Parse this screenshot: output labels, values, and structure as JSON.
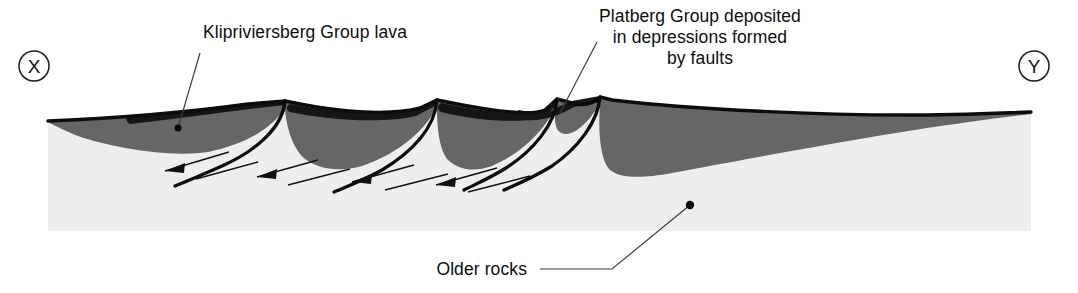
{
  "figure": {
    "kind": "geological-cross-section",
    "title_visible": false,
    "endpoints": {
      "left_label": "X",
      "right_label": "Y"
    },
    "annotations": [
      {
        "id": "klipriviersberg",
        "lines": [
          "Klipriviersberg Group lava"
        ],
        "align": "middle",
        "text_x": 305,
        "text_y": 38,
        "line_height": 21,
        "leader_points": "200,53 178,128",
        "dot_x": 178,
        "dot_y": 128,
        "dot_r": 3.6
      },
      {
        "id": "platberg",
        "lines": [
          "Platberg Group deposited",
          "in depressions formed",
          "by faults"
        ],
        "align": "middle",
        "text_x": 700,
        "text_y": 22,
        "line_height": 21,
        "leader_points": "597,42 560,113",
        "dot_x": null,
        "dot_y": null,
        "dot_r": 0
      },
      {
        "id": "older-rocks",
        "lines": [
          "Older rocks"
        ],
        "align": "end",
        "text_x": 527,
        "text_y": 275,
        "line_height": 21,
        "leader_points": "540,269 612,269 690,205",
        "dot_x": 690,
        "dot_y": 205,
        "dot_r": 4.2
      }
    ],
    "units": [
      {
        "id": "older-rocks-basement",
        "name": "Older rocks",
        "color": "#eeeeee"
      },
      {
        "id": "klipriviersberg-lava",
        "name": "Klipriviersberg Group lava",
        "color": "#666666"
      },
      {
        "id": "platberg-group",
        "name": "Platberg Group",
        "color": "#151515"
      }
    ],
    "structures": {
      "fault_count": 4,
      "fault_type": "normal",
      "movement_indicator": "paired slip arrows",
      "arrow_direction": "down-dip to the left"
    },
    "colors": {
      "basement": "#eeeeee",
      "lava": "#666666",
      "platberg": "#151515",
      "outline": "#0c0c0c",
      "background": "#ffffff",
      "leader": "#3a3a3a",
      "text": "#0d0d0d"
    },
    "geometry": {
      "section_left_x": 48,
      "section_right_x": 1031,
      "section_base_y": 231,
      "surface_left_y": 121,
      "surface_right_y": 112,
      "peak_x_positions": [
        285,
        437,
        557,
        600
      ],
      "peak_y_positions": [
        101,
        100,
        99,
        97
      ]
    }
  }
}
